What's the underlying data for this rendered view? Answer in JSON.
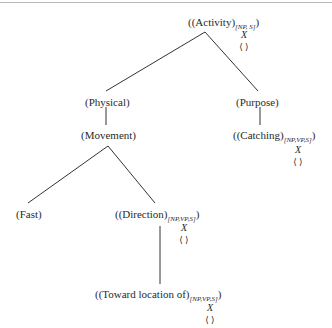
{
  "diagram": {
    "type": "tree",
    "nodes": {
      "activity": {
        "open": "((Activity)",
        "sub": "[NP, S]",
        "close": ")",
        "mark": "X",
        "empty": "⟨ ⟩"
      },
      "physical": {
        "label": "(Physical)"
      },
      "purpose": {
        "label": "(Purpose)"
      },
      "movement": {
        "label": "(Movement)"
      },
      "catching": {
        "open": "((Catching)",
        "sub": "[NP,VP,S]",
        "close": ")",
        "mark": "X",
        "empty": "⟨ ⟩"
      },
      "fast": {
        "label": "(Fast)"
      },
      "direction": {
        "open": "((Direction)",
        "sub": "[NP,VP,S]",
        "close": ")",
        "mark": "X",
        "empty": "⟨ ⟩"
      },
      "toward": {
        "open": "((Toward location of)",
        "sub": "[NP,VP,S]",
        "close": ")",
        "mark": "X",
        "empty": "⟨ ⟩"
      }
    },
    "edges": [
      [
        "activity",
        "physical"
      ],
      [
        "activity",
        "purpose"
      ],
      [
        "physical",
        "movement"
      ],
      [
        "purpose",
        "catching"
      ],
      [
        "movement",
        "fast"
      ],
      [
        "movement",
        "direction"
      ],
      [
        "direction",
        "toward"
      ]
    ]
  }
}
